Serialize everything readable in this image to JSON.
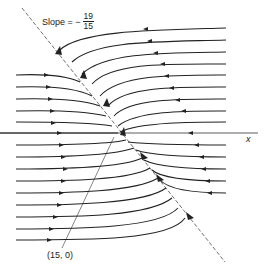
{
  "figure": {
    "slope_label": {
      "prefix": "Slope = −",
      "numerator": "19",
      "denominator": "15"
    },
    "axis_label": "x",
    "point_label": "(15, 0)",
    "caption_partial": "... (cut off) ...",
    "colors": {
      "ink": "#222222",
      "background": "#ffffff"
    },
    "diagonal_line": {
      "slope": "-19/15",
      "through_point": [
        15,
        0
      ],
      "style": "dashed"
    },
    "upper_flow_lines": {
      "count": 9,
      "direction": "leftward, curving down onto diagonal line"
    },
    "lower_flow_lines": {
      "count": 14,
      "direction": "rightward, curving up onto diagonal line"
    }
  }
}
